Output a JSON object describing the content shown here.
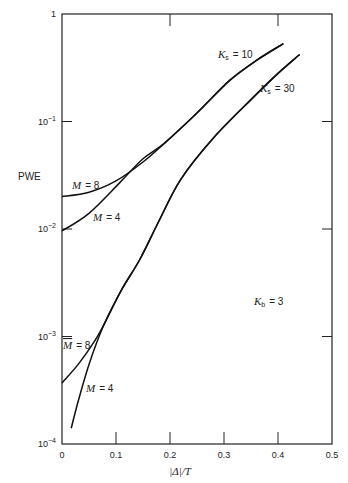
{
  "chart_data": {
    "type": "line",
    "title": "",
    "xlabel": "|Δ|/T",
    "ylabel": "PWE",
    "xlim": [
      0,
      0.5
    ],
    "ylim": [
      0.0001,
      1
    ],
    "yscale": "log",
    "grid": false,
    "x_ticks": [
      "0",
      "0.1",
      "0.2",
      "0.3",
      "0.4",
      "0.5"
    ],
    "y_ticks": [
      {
        "base": "1",
        "exp": ""
      },
      {
        "base": "10",
        "exp": "−1"
      },
      {
        "base": "10",
        "exp": "−2"
      },
      {
        "base": "10",
        "exp": "−3"
      },
      {
        "base": "10",
        "exp": "−4"
      }
    ],
    "annotations": {
      "ks10": {
        "sym": "K",
        "sub": "s",
        "val": "= 10"
      },
      "ks30": {
        "sym": "K",
        "sub": "s",
        "val": "= 30"
      },
      "kb": {
        "sym": "K",
        "sub": "b",
        "val": "= 3"
      },
      "m8_upper": {
        "sym": "M",
        "val": "= 8"
      },
      "m4_upper": {
        "sym": "M",
        "val": "= 4"
      },
      "m8_lower": {
        "sym": "M",
        "val": "= 8"
      },
      "m4_lower": {
        "sym": "M",
        "val": "= 4"
      }
    },
    "series": [
      {
        "name": "Ks = 10, M = 8",
        "x": [
          0,
          0.05,
          0.1,
          0.15,
          0.19,
          0.25,
          0.31,
          0.36,
          0.41
        ],
        "y": [
          0.02,
          0.022,
          0.028,
          0.042,
          0.063,
          0.12,
          0.24,
          0.37,
          0.53
        ]
      },
      {
        "name": "Ks = 10, M = 4",
        "x": [
          0,
          0.05,
          0.107,
          0.15,
          0.19,
          0.25,
          0.31,
          0.36,
          0.41
        ],
        "y": [
          0.0096,
          0.014,
          0.027,
          0.045,
          0.063,
          0.12,
          0.24,
          0.37,
          0.53
        ]
      },
      {
        "name": "Ks = 30, M = 8",
        "x": [
          0,
          0.03,
          0.06,
          0.078,
          0.11,
          0.144,
          0.18,
          0.22,
          0.28,
          0.35,
          0.4,
          0.44
        ],
        "y": [
          0.00037,
          0.00055,
          0.0009,
          0.0013,
          0.0027,
          0.0052,
          0.012,
          0.029,
          0.07,
          0.16,
          0.28,
          0.42
        ]
      },
      {
        "name": "Ks = 30, M = 4",
        "x": [
          0.017,
          0.03,
          0.05,
          0.078,
          0.11,
          0.144,
          0.18,
          0.22,
          0.28,
          0.35,
          0.4,
          0.44
        ],
        "y": [
          0.00014,
          0.00025,
          0.00055,
          0.0013,
          0.0027,
          0.0052,
          0.012,
          0.029,
          0.07,
          0.16,
          0.28,
          0.42
        ]
      }
    ]
  }
}
